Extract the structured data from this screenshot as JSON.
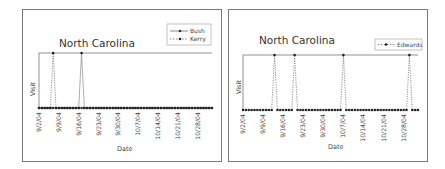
{
  "chart_data": [
    {
      "type": "line",
      "title": "North Carolina",
      "xlabel": "Date",
      "ylabel": "Visit",
      "x_tick_labels": [
        "9/2/04",
        "9/9/04",
        "9/16/04",
        "9/23/04",
        "9/30/04",
        "10/7/04",
        "10/14/04",
        "10/21/04",
        "10/28/04"
      ],
      "x_range": [
        "9/2/04",
        "11/2/04"
      ],
      "ylim": [
        0,
        1
      ],
      "grid": false,
      "legend_position": "top-right",
      "series": [
        {
          "name": "Bush",
          "style": "solid",
          "visit_dates": [
            "9/17/04"
          ]
        },
        {
          "name": "Kerry",
          "style": "dashed",
          "visit_dates": [
            "9/7/04"
          ]
        }
      ]
    },
    {
      "type": "line",
      "title": "North Carolina",
      "xlabel": "Date",
      "ylabel": "Visit",
      "x_tick_labels": [
        "9/2/04",
        "9/9/04",
        "9/16/04",
        "9/23/04",
        "9/30/04",
        "10/7/04",
        "10/14/04",
        "10/21/04",
        "10/28/04"
      ],
      "x_range": [
        "9/2/04",
        "11/2/04"
      ],
      "ylim": [
        0,
        1
      ],
      "grid": false,
      "legend_position": "top-right",
      "series": [
        {
          "name": "Edwards",
          "style": "dashed",
          "visit_dates": [
            "9/13/04",
            "9/20/04",
            "10/7/04",
            "10/30/04"
          ]
        }
      ]
    }
  ],
  "left": {
    "title": "North Carolina",
    "ylabel": "Visit",
    "xlabel": "Date",
    "legend": [
      "Bush",
      "Kerry"
    ],
    "ticks": [
      "9/2/04",
      "9/9/04",
      "9/16/04",
      "9/23/04",
      "9/30/04",
      "10/7/04",
      "10/14/04",
      "10/21/04",
      "10/28/04"
    ]
  },
  "right": {
    "title": "North Carolina",
    "ylabel": "Visit",
    "xlabel": "Date",
    "legend": [
      "Edwards"
    ],
    "ticks": [
      "9/2/04",
      "9/9/04",
      "9/16/04",
      "9/23/04",
      "9/30/04",
      "10/7/04",
      "10/14/04",
      "10/21/04",
      "10/28/04"
    ]
  }
}
